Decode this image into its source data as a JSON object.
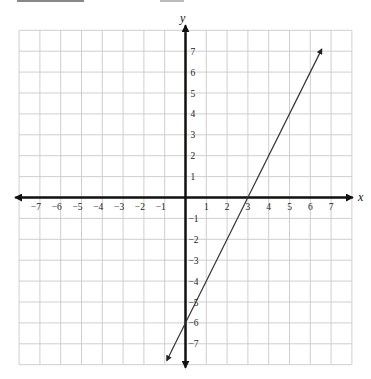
{
  "chart_data": {
    "type": "line",
    "title": "",
    "xlabel": "x",
    "ylabel": "y",
    "xlim": [
      -8,
      8
    ],
    "ylim": [
      -8,
      8
    ],
    "grid": true,
    "x_ticks": [
      -7,
      -6,
      -5,
      -4,
      -3,
      -2,
      -1,
      1,
      2,
      3,
      4,
      5,
      6,
      7
    ],
    "y_ticks": [
      7,
      6,
      5,
      4,
      3,
      2,
      1,
      -1,
      -2,
      -3,
      -4,
      -5,
      -6,
      -7
    ],
    "x_tick_labels": [
      "−7",
      "−6",
      "−5",
      "−4",
      "−3",
      "−2",
      "−1",
      "1",
      "2",
      "3",
      "4",
      "5",
      "6",
      "7"
    ],
    "y_tick_labels": [
      "7",
      "6",
      "5",
      "4",
      "3",
      "2",
      "1",
      "−1",
      "−2",
      "−3",
      "−4",
      "−5",
      "−6",
      "−7"
    ],
    "series": [
      {
        "name": "line",
        "equation": "y = 2x - 6",
        "slope": 2,
        "y_intercept": -6,
        "x_intercept": 3,
        "x": [
          -0.9,
          6.55
        ],
        "y": [
          -7.8,
          7.1
        ],
        "arrows_both_ends": true
      }
    ],
    "legend": null
  },
  "header": {
    "text_visible": false
  }
}
